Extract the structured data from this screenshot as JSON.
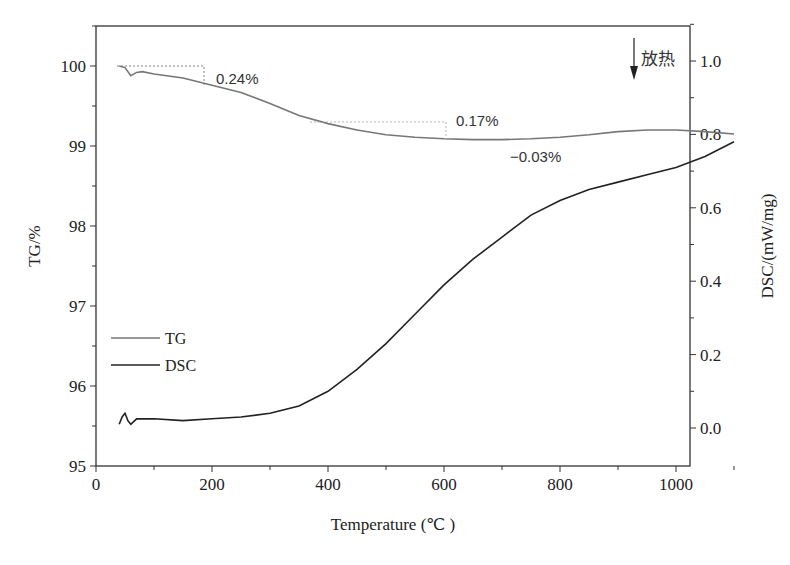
{
  "chart_data": {
    "type": "line",
    "title": "",
    "xlabel": "Temperature (℃ )",
    "ylabel_left": "TG/%",
    "ylabel_right": "DSC/(mW/mg)",
    "xlim": [
      0,
      1100
    ],
    "ylim_left": [
      95,
      100.5
    ],
    "ylim_right": [
      -0.1,
      1.1
    ],
    "x_ticks": [
      "0",
      "200",
      "400",
      "600",
      "800",
      "1000"
    ],
    "y_left_ticks": [
      "95",
      "96",
      "97",
      "98",
      "99",
      "100"
    ],
    "y_right_ticks": [
      "0.0",
      "0.2",
      "0.4",
      "0.6",
      "0.8",
      "1.0"
    ],
    "grid": false,
    "legend_position": "lower-left inside",
    "series": [
      {
        "name": "TG",
        "axis": "left",
        "color": "#777777",
        "x": [
          40,
          50,
          60,
          70,
          80,
          100,
          150,
          200,
          250,
          300,
          350,
          400,
          450,
          500,
          550,
          600,
          650,
          700,
          750,
          800,
          850,
          900,
          950,
          1000,
          1050,
          1100
        ],
        "y": [
          100.0,
          99.98,
          99.88,
          99.92,
          99.93,
          99.9,
          99.85,
          99.76,
          99.67,
          99.53,
          99.38,
          99.28,
          99.2,
          99.14,
          99.11,
          99.09,
          99.08,
          99.08,
          99.09,
          99.11,
          99.14,
          99.18,
          99.2,
          99.2,
          99.18,
          99.15
        ]
      },
      {
        "name": "DSC",
        "axis": "right",
        "color": "#222222",
        "x": [
          40,
          45,
          50,
          55,
          60,
          70,
          100,
          150,
          200,
          250,
          300,
          350,
          400,
          450,
          500,
          550,
          600,
          650,
          700,
          750,
          800,
          850,
          900,
          950,
          1000,
          1050,
          1100
        ],
        "y": [
          0.01,
          0.03,
          0.04,
          0.02,
          0.01,
          0.025,
          0.025,
          0.02,
          0.025,
          0.03,
          0.04,
          0.06,
          0.1,
          0.16,
          0.23,
          0.31,
          0.39,
          0.46,
          0.52,
          0.58,
          0.62,
          0.65,
          0.67,
          0.69,
          0.71,
          0.74,
          0.78
        ]
      }
    ],
    "annotations": [
      {
        "text": "0.24%",
        "x_range": [
          40,
          200
        ],
        "level": 100.0
      },
      {
        "text": "0.17%",
        "x_range": [
          400,
          650
        ],
        "level": 99.3
      },
      {
        "text": "−0.03%",
        "x": 650
      },
      {
        "text": "放热",
        "arrow": "down"
      }
    ]
  },
  "legend": {
    "tg_label": "TG",
    "dsc_label": "DSC"
  }
}
